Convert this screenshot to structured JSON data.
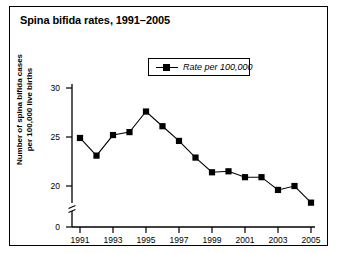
{
  "figure": {
    "title": "Spina bifida rates, 1991–2005",
    "background_color": "#ffffff",
    "border_color": "#000000",
    "series_color": "#000000"
  },
  "legend": {
    "label": "Rate per 100,000",
    "marker": "filled-square-with-line",
    "position": "upper-center"
  },
  "axes": {
    "y_title_line1": "Number of spina bifida cases",
    "y_title_line2": "per 100,000 live births",
    "y_ticks": [
      "0",
      "20",
      "25",
      "30"
    ],
    "y_axis_break": true,
    "x_ticks": [
      "1991",
      "1993",
      "1995",
      "1997",
      "1999",
      "2001",
      "2003",
      "2005"
    ]
  },
  "chart_data": {
    "type": "line",
    "title": "Spina bifida rates, 1991–2005",
    "xlabel": "",
    "ylabel": "Number of spina bifida cases per 100,000 live births",
    "x": [
      1991,
      1992,
      1993,
      1994,
      1995,
      1996,
      1997,
      1998,
      1999,
      2000,
      2001,
      2002,
      2003,
      2004,
      2005
    ],
    "series": [
      {
        "name": "Rate per 100,000",
        "values": [
          24.9,
          23.1,
          25.2,
          25.5,
          27.6,
          26.1,
          24.6,
          22.9,
          21.4,
          21.5,
          20.9,
          20.9,
          19.6,
          20.0,
          18.3
        ]
      }
    ],
    "categories": [
      "1991",
      "1992",
      "1993",
      "1994",
      "1995",
      "1996",
      "1997",
      "1998",
      "1999",
      "2000",
      "2001",
      "2002",
      "2003",
      "2004",
      "2005"
    ],
    "xlim": [
      1990.4,
      2005.6
    ],
    "ylim": [
      18.0,
      30.0
    ],
    "y_ticks": [
      20,
      25,
      30
    ],
    "x_ticks": [
      1991,
      1993,
      1995,
      1997,
      1999,
      2001,
      2003,
      2005
    ],
    "grid": false,
    "legend_position": "upper center",
    "marker": "square",
    "axis_break_y": true
  }
}
